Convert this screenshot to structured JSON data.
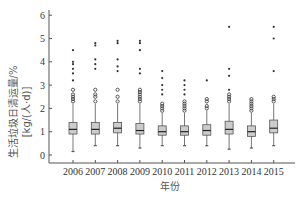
{
  "chart_data": {
    "type": "box",
    "title": "",
    "xlabel": "年份",
    "ylabel": "生活垃圾日清运量/%",
    "ylabel_line2": "[kg/(人·d)]",
    "ylim": [
      0,
      6
    ],
    "yticks": [
      0,
      1,
      2,
      3,
      4,
      5,
      6
    ],
    "grid": false,
    "legend": null,
    "categories": [
      "2006",
      "2007",
      "2008",
      "2009",
      "2010",
      "2011",
      "2012",
      "2013",
      "2014",
      "2015"
    ],
    "boxes": [
      {
        "year": "2006",
        "whisker_low": 0.15,
        "q1": 0.9,
        "median": 1.1,
        "q3": 1.4,
        "whisker_high": 2.2,
        "outliers_circle": [
          2.3,
          2.4,
          2.5,
          2.6,
          2.8
        ],
        "outliers_star": [
          3.2,
          3.5,
          3.7,
          3.9,
          4.0,
          4.5
        ]
      },
      {
        "year": "2007",
        "whisker_low": 0.4,
        "q1": 0.9,
        "median": 1.1,
        "q3": 1.4,
        "whisker_high": 2.2,
        "outliers_circle": [
          2.3,
          2.5,
          2.6,
          2.8
        ],
        "outliers_star": [
          3.7,
          3.9,
          4.1,
          4.7,
          4.8
        ]
      },
      {
        "year": "2008",
        "whisker_low": 0.4,
        "q1": 0.95,
        "median": 1.15,
        "q3": 1.4,
        "whisker_high": 2.2,
        "outliers_circle": [
          2.3,
          2.5,
          2.8
        ],
        "outliers_star": [
          3.6,
          3.8,
          4.1,
          4.8,
          4.9
        ]
      },
      {
        "year": "2009",
        "whisker_low": 0.3,
        "q1": 0.9,
        "median": 1.05,
        "q3": 1.35,
        "whisker_high": 2.2,
        "outliers_circle": [
          2.3,
          2.4,
          2.5,
          2.6,
          2.7,
          2.8
        ],
        "outliers_star": [
          3.5,
          3.7,
          4.5,
          4.8,
          4.9
        ]
      },
      {
        "year": "2010",
        "whisker_low": 0.4,
        "q1": 0.85,
        "median": 1.0,
        "q3": 1.25,
        "whisker_high": 1.8,
        "outliers_circle": [
          1.9,
          2.0,
          2.1,
          2.2
        ],
        "outliers_star": [
          2.6,
          2.8,
          3.0,
          3.3,
          3.6
        ]
      },
      {
        "year": "2011",
        "whisker_low": 0.4,
        "q1": 0.85,
        "median": 1.0,
        "q3": 1.25,
        "whisker_high": 1.8,
        "outliers_circle": [
          1.9,
          2.0,
          2.1,
          2.2,
          2.3
        ],
        "outliers_star": [
          2.6,
          2.8,
          3.0,
          3.2
        ]
      },
      {
        "year": "2012",
        "whisker_low": 0.4,
        "q1": 0.85,
        "median": 1.05,
        "q3": 1.3,
        "whisker_high": 1.9,
        "outliers_circle": [
          2.0,
          2.1,
          2.3,
          2.4
        ],
        "outliers_star": [
          3.2
        ]
      },
      {
        "year": "2013",
        "whisker_low": 0.25,
        "q1": 0.9,
        "median": 1.1,
        "q3": 1.45,
        "whisker_high": 2.2,
        "outliers_circle": [
          2.3,
          2.4,
          2.5,
          2.6
        ],
        "outliers_star": [
          2.8,
          3.4,
          3.7,
          5.5
        ]
      },
      {
        "year": "2014",
        "whisker_low": 0.3,
        "q1": 0.8,
        "median": 1.0,
        "q3": 1.25,
        "whisker_high": 1.8,
        "outliers_circle": [
          1.9,
          2.0,
          2.1,
          2.2,
          2.3,
          2.4
        ],
        "outliers_star": []
      },
      {
        "year": "2015",
        "whisker_low": 0.4,
        "q1": 0.95,
        "median": 1.15,
        "q3": 1.5,
        "whisker_high": 2.2,
        "outliers_circle": [
          2.3,
          2.4,
          2.5
        ],
        "outliers_star": [
          3.6,
          5.0,
          5.5
        ]
      }
    ],
    "colors": {
      "box_fill": "#cccccc",
      "box_stroke": "#555555",
      "median": "#222222",
      "axis": "#555555",
      "outlier": "#333333"
    }
  }
}
